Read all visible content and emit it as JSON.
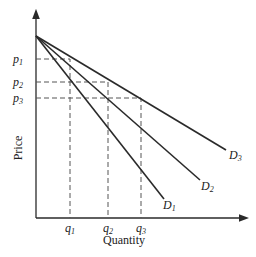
{
  "diagram": {
    "title": "",
    "axes": {
      "y_label": "Price",
      "x_label": "Quantity"
    },
    "price_levels": [
      {
        "label": "p",
        "sub": "1",
        "y": 59
      },
      {
        "label": "p",
        "sub": "2",
        "y": 82
      },
      {
        "label": "p",
        "sub": "3",
        "y": 98
      }
    ],
    "quantity_levels": [
      {
        "label": "q",
        "sub": "1",
        "x": 70
      },
      {
        "label": "q",
        "sub": "2",
        "x": 108
      },
      {
        "label": "q",
        "sub": "3",
        "x": 141
      }
    ],
    "demand_curves": [
      {
        "label": "D",
        "sub": "1"
      },
      {
        "label": "D",
        "sub": "2"
      },
      {
        "label": "D",
        "sub": "3"
      }
    ],
    "colors": {
      "line": "#2a2a2a",
      "dashed": "#555555",
      "text": "#222222"
    }
  }
}
